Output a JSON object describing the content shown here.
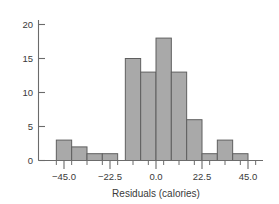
{
  "chart_data": {
    "type": "bar",
    "title": "",
    "subtitle": "",
    "xlabel": "Residuals (calories)",
    "ylabel": "",
    "categories": [
      "-48.75 to -41.25",
      "-41.25 to -33.75",
      "-33.75 to -26.25",
      "-26.25 to -18.75",
      "-11.25 to -3.75",
      "-3.75 to 3.75",
      "3.75 to 11.25",
      "11.25 to 18.75",
      "18.75 to 26.25",
      "26.25 to 33.75",
      "33.75 to 41.25",
      "41.25 to 48.75"
    ],
    "bin_edges": [
      -48.75,
      -41.25,
      -33.75,
      -26.25,
      -18.75,
      -11.25,
      -3.75,
      3.75,
      11.25,
      18.75,
      26.25,
      33.75,
      41.25,
      48.75
    ],
    "values": [
      3,
      2,
      1,
      1,
      15,
      13,
      18,
      13,
      6,
      1,
      3,
      1
    ],
    "bars": [
      {
        "x0": -48.75,
        "x1": -41.25,
        "value": 3
      },
      {
        "x0": -41.25,
        "x1": -33.75,
        "value": 2
      },
      {
        "x0": -33.75,
        "x1": -26.25,
        "value": 1
      },
      {
        "x0": -26.25,
        "x1": -18.75,
        "value": 1
      },
      {
        "x0": -15.0,
        "x1": -7.5,
        "value": 15
      },
      {
        "x0": -7.5,
        "x1": 0.0,
        "value": 13
      },
      {
        "x0": 0.0,
        "x1": 7.5,
        "value": 18
      },
      {
        "x0": 7.5,
        "x1": 15.0,
        "value": 13
      },
      {
        "x0": 15.0,
        "x1": 22.5,
        "value": 6
      },
      {
        "x0": 22.5,
        "x1": 30.0,
        "value": 1
      },
      {
        "x0": 30.0,
        "x1": 37.5,
        "value": 3
      },
      {
        "x0": 37.5,
        "x1": 45.0,
        "value": 1
      }
    ],
    "xticks": [
      -45.0,
      -22.5,
      0.0,
      22.5,
      45.0
    ],
    "xtick_labels": [
      "−45.0",
      "−22.5",
      "0.0",
      "22.5",
      "45.0"
    ],
    "yticks": [
      0,
      5,
      10,
      15,
      20
    ],
    "ytick_labels": [
      "0",
      "5",
      "10",
      "15",
      "20"
    ],
    "xlim": [
      -56.25,
      52.5
    ],
    "ylim": [
      0,
      21.5
    ],
    "grid": false,
    "legend": null,
    "colors": {
      "bar_fill": "#a9a9a9",
      "bar_stroke": "#5f5f5f",
      "axis": "#6b6b6b",
      "text": "#3a3a3a",
      "background": "#ffffff"
    }
  },
  "labels": {
    "xlabel": "Residuals (calories)",
    "ytick_0": "0",
    "ytick_5": "5",
    "ytick_10": "10",
    "ytick_15": "15",
    "ytick_20": "20",
    "xtick_neg45": "−45.0",
    "xtick_neg225": "−22.5",
    "xtick_0": "0.0",
    "xtick_225": "22.5",
    "xtick_45": "45.0"
  }
}
